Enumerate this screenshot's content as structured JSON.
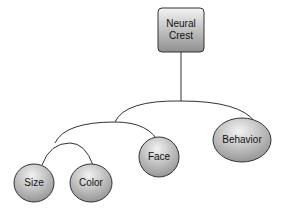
{
  "diagram": {
    "type": "tree",
    "root": {
      "label_line1": "Neural",
      "label_line2": "Crest"
    },
    "nodes": [
      {
        "id": "size",
        "label": "Size"
      },
      {
        "id": "color",
        "label": "Color"
      },
      {
        "id": "face",
        "label": "Face"
      },
      {
        "id": "behavior",
        "label": "Behavior"
      }
    ],
    "colors": {
      "fill_light": "#f2f2f2",
      "fill_dark": "#9a9a9a",
      "stroke": "#333333"
    }
  }
}
